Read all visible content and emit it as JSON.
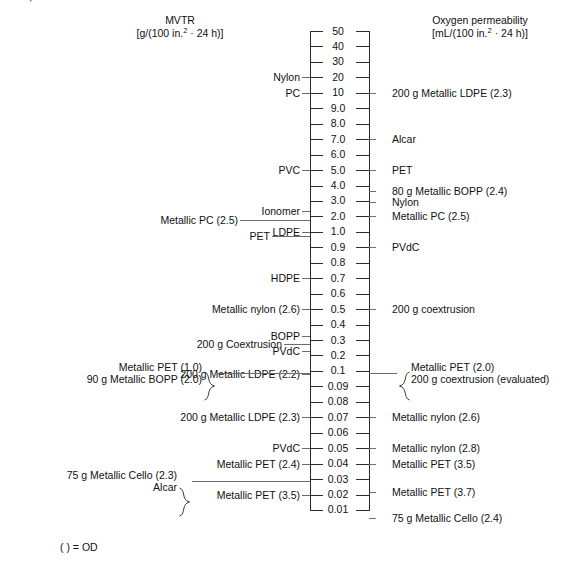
{
  "figure": {
    "cropped_top_caption": "…ARY, ORIENTED POLYESTER",
    "footnote": "( ) = OD",
    "left_axis": {
      "title": "MVTR",
      "units_prefix": "[g/(100 in.",
      "units_exponent": "2",
      "units_suffix": " · 24 h)]"
    },
    "right_axis": {
      "title": "Oxygen permeability",
      "units_prefix": "[mL/(100 in.",
      "units_exponent": "2",
      "units_suffix": " · 24 h)]"
    }
  },
  "chart_data": {
    "type": "scatter",
    "subtitle": "( ) = OD",
    "orientation": "vertical-dual-axis-ladder",
    "scale": "logarithmic-ladder",
    "grid": false,
    "legend": null,
    "xlabel": "",
    "ylabel": "",
    "axis_ticks": [
      "50",
      "40",
      "30",
      "20",
      "10",
      "9.0",
      "8.0",
      "7.0",
      "6.0",
      "5.0",
      "4.0",
      "3.0",
      "2.0",
      "1.0",
      "0.9",
      "0.8",
      "0.7",
      "0.6",
      "0.5",
      "0.4",
      "0.3",
      "0.2",
      "0.1",
      "0.09",
      "0.08",
      "0.07",
      "0.06",
      "0.05",
      "0.04",
      "0.03",
      "0.02",
      "0.01"
    ],
    "ylim": [
      "50",
      "0.01"
    ],
    "series": [
      {
        "name": "MVTR [g/(100 in.2 · 24 h)]",
        "side": "left",
        "xlabel": "MVTR",
        "points": [
          {
            "label": "Nylon",
            "value": "20",
            "tick": "20"
          },
          {
            "label": "PC",
            "value": "10",
            "tick": "10"
          },
          {
            "label": "PVC",
            "value": "5.0",
            "tick": "5.0"
          },
          {
            "label": "Ionomer",
            "value": "2.0",
            "tick": "2.0"
          },
          {
            "label": "Metallic PC (2.5)",
            "value": "1.5",
            "tick": "2.0"
          },
          {
            "label": "PET",
            "value": "1.2",
            "tick": "1.0"
          },
          {
            "label": "LDPE",
            "value": "1.0",
            "tick": "1.0"
          },
          {
            "label": "HDPE",
            "value": "0.7",
            "tick": "0.7"
          },
          {
            "label": "Metallic nylon (2.6)",
            "value": "0.5",
            "tick": "0.5"
          },
          {
            "label": "BOPP",
            "value": "0.3",
            "tick": "0.3"
          },
          {
            "label": "200 g Coextrusion",
            "value": "0.3",
            "tick": "0.3"
          },
          {
            "label": "PVdC",
            "value": "0.2",
            "tick": "0.2"
          },
          {
            "label": "200 g Metallic LDPE (2.2)",
            "value": "0.1",
            "tick": "0.1"
          },
          {
            "label": "Metallic PET (1.0)",
            "value": "0.1",
            "tick": "0.1",
            "braced": true
          },
          {
            "label": "90 g Metallic BOPP (2.0)",
            "value": "0.1",
            "tick": "0.1",
            "braced": true
          },
          {
            "label": "200 g Metallic LDPE (2.3)",
            "value": "0.07",
            "tick": "0.07"
          },
          {
            "label": "PVdC",
            "value": "0.05",
            "tick": "0.05"
          },
          {
            "label": "Metallic PET (2.4)",
            "value": "0.04",
            "tick": "0.04"
          },
          {
            "label": "75 g Metallic Cello (2.3)",
            "value": "0.03",
            "tick": "0.03",
            "braced": true
          },
          {
            "label": "Alcar",
            "value": "0.03",
            "tick": "0.03",
            "braced": true
          },
          {
            "label": "Metallic PET (3.5)",
            "value": "0.02",
            "tick": "0.02"
          }
        ]
      },
      {
        "name": "Oxygen permeability [mL/(100 in.2 · 24 h)]",
        "side": "right",
        "xlabel": "Oxygen permeability",
        "points": [
          {
            "label": "200 g Metallic LDPE (2.3)",
            "value": "10",
            "tick": "10"
          },
          {
            "label": "Alcar",
            "value": "7.0",
            "tick": "7.0"
          },
          {
            "label": "PET",
            "value": "5.0",
            "tick": "5.0"
          },
          {
            "label": "80 g Metallic BOPP (2.4)",
            "value": "3.5",
            "tick": "4.0"
          },
          {
            "label": "Nylon",
            "value": "3.0",
            "tick": "3.0"
          },
          {
            "label": "Metallic PC (2.5)",
            "value": "2.0",
            "tick": "2.0"
          },
          {
            "label": "PVdC",
            "value": "0.9",
            "tick": "0.9"
          },
          {
            "label": "200 g coextrusion",
            "value": "0.5",
            "tick": "0.5"
          },
          {
            "label": "Metallic PET (2.0)",
            "value": "0.1",
            "tick": "0.1",
            "braced": true
          },
          {
            "label": "200 g coextrusion (evaluated)",
            "value": "0.1",
            "tick": "0.1",
            "braced": true
          },
          {
            "label": "Metallic nylon (2.6)",
            "value": "0.07",
            "tick": "0.07"
          },
          {
            "label": "Metallic nylon (2.8)",
            "value": "0.05",
            "tick": "0.05"
          },
          {
            "label": "Metallic PET (3.5)",
            "value": "0.04",
            "tick": "0.04"
          },
          {
            "label": "Metallic PET (3.7)",
            "value": "0.02",
            "tick": "0.02"
          },
          {
            "label": "75 g Metallic Cello (2.4)",
            "value": "0.01",
            "tick": "0.01"
          }
        ]
      }
    ]
  }
}
